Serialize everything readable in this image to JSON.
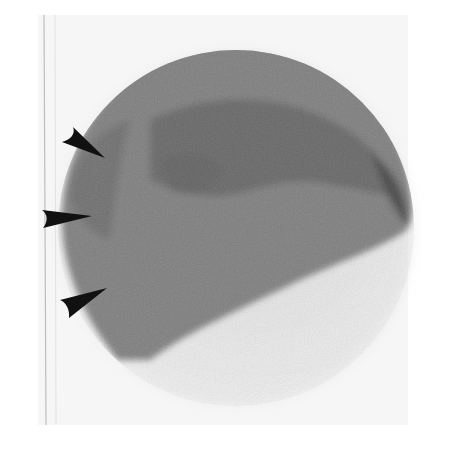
{
  "image": {
    "type": "scintigraphy-scan",
    "description": "Grainy circular nuclear medicine image with reduced uptake in lower portion",
    "colors": {
      "background": "#ffffff",
      "film": "#f4f4f4",
      "uptake_dark": "#2a2a2a",
      "uptake_mid": "#5a5a5a",
      "arrow": "#111111"
    },
    "arrows": [
      {
        "id": "arrow-upper",
        "tip": [
          105,
          158
        ],
        "tail": [
          62,
          140
        ]
      },
      {
        "id": "arrow-middle",
        "tip": [
          92,
          216
        ],
        "tail": [
          42,
          212
        ]
      },
      {
        "id": "arrow-lower",
        "tip": [
          107,
          288
        ],
        "tail": [
          60,
          300
        ]
      }
    ]
  }
}
